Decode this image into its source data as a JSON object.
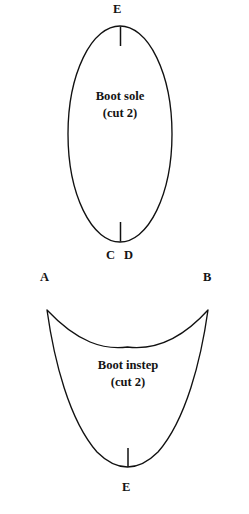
{
  "document": {
    "type": "sewing-pattern-diagram",
    "background_color": "#ffffff",
    "ink_color": "#111111",
    "width": 249,
    "height": 514
  },
  "pieces": [
    {
      "id": "boot-sole",
      "name": "Boot sole",
      "caption_title": "Boot sole",
      "caption_sub": "(cut 2)",
      "shape": "ellipse",
      "vertex_labels": [
        {
          "id": "sole-top",
          "text": "E",
          "position": "top"
        },
        {
          "id": "sole-bottom-left",
          "text": "C",
          "position": "bottom-left"
        },
        {
          "id": "sole-bottom-right",
          "text": "D",
          "position": "bottom-right"
        }
      ],
      "notches": [
        {
          "id": "sole-top-notch",
          "position": "top-center"
        },
        {
          "id": "sole-bottom-notch",
          "position": "bottom-center"
        }
      ]
    },
    {
      "id": "boot-instep",
      "name": "Boot instep",
      "caption_title": "Boot instep",
      "caption_sub": "(cut 2)",
      "shape": "u-shape-concave-top",
      "vertex_labels": [
        {
          "id": "instep-top-left",
          "text": "A",
          "position": "top-left"
        },
        {
          "id": "instep-top-right",
          "text": "B",
          "position": "top-right"
        },
        {
          "id": "instep-bottom",
          "text": "E",
          "position": "bottom-center"
        }
      ],
      "notches": [
        {
          "id": "instep-bottom-notch",
          "position": "bottom-center"
        }
      ]
    }
  ],
  "labels": {
    "sole_top": "E",
    "sole_bottom_c": "C",
    "sole_bottom_d": "D",
    "sole_caption_title": "Boot sole",
    "sole_caption_sub": "(cut 2)",
    "instep_top_left": "A",
    "instep_top_right": "B",
    "instep_bottom": "E",
    "instep_caption_title": "Boot instep",
    "instep_caption_sub": "(cut 2)"
  }
}
